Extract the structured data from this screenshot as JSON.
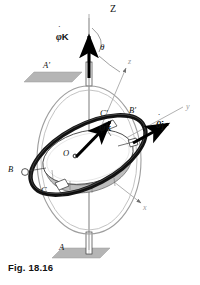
{
  "figure": {
    "caption": "Fig. 18.16",
    "background": "#ffffff"
  },
  "colors": {
    "ink": "#111111",
    "gimbal_outer": "#8f8f8f",
    "gimbal_inner": "#1a1a1a",
    "rotor_rim": "#b9b9b9",
    "rotor_face": "#ffffff",
    "support_plate": "#b5b5b5",
    "axis_light": "#9a9a9a",
    "vector_black": "#000000"
  },
  "axes": [
    {
      "id": "Z",
      "label": "Z",
      "style": "upright",
      "x": 112,
      "y": 8,
      "color": "#111111"
    },
    {
      "id": "z",
      "label": "z",
      "style": "italic",
      "x": 128,
      "y": 60,
      "color": "#9a9a9a"
    },
    {
      "id": "y",
      "label": "y",
      "style": "italic",
      "x": 186,
      "y": 108,
      "color": "#9a9a9a"
    },
    {
      "id": "x",
      "label": "x",
      "style": "italic",
      "x": 143,
      "y": 208,
      "color": "#9a9a9a"
    },
    {
      "id": "theta",
      "label": "θ",
      "style": "italic",
      "x": 101,
      "y": 45,
      "color": "#111111"
    }
  ],
  "vectors": [
    {
      "id": "phi-dot-K",
      "symbol": "φ",
      "accent": "˙",
      "unit": "K",
      "label": "φ̇K",
      "description": "precession rate about fixed Z axis",
      "label_x": 57,
      "label_y": 38
    },
    {
      "id": "theta-dot-j",
      "symbol": "θ",
      "accent": "˙",
      "unit": "j",
      "label": "θ̇j",
      "description": "nutation rate about y axis",
      "label_x": 156,
      "label_y": 125
    },
    {
      "id": "psi-dot-k",
      "symbol": "ψ",
      "accent": "˙",
      "unit": "k",
      "label": "ψ̇k",
      "description": "spin rate about z axis of rotor",
      "label_x": 100,
      "label_y": 128
    }
  ],
  "points": [
    {
      "id": "A-prime",
      "label": "A'",
      "x": 43,
      "y": 66,
      "note": "upper support bearing"
    },
    {
      "id": "A",
      "label": "A",
      "x": 60,
      "y": 249,
      "note": "lower support bearing"
    },
    {
      "id": "B-prime",
      "label": "B'",
      "x": 130,
      "y": 111,
      "note": "outer gimbal bearing right"
    },
    {
      "id": "B",
      "label": "B",
      "x": 9,
      "y": 165,
      "note": "outer gimbal bearing left"
    },
    {
      "id": "C-prime",
      "label": "C'",
      "x": 100,
      "y": 113,
      "note": "inner gimbal bearing upper"
    },
    {
      "id": "C",
      "label": "C",
      "x": 42,
      "y": 190,
      "note": "inner gimbal bearing lower"
    },
    {
      "id": "O",
      "label": "O",
      "x": 64,
      "y": 154,
      "note": "fixed point at centre"
    }
  ],
  "parts": [
    {
      "id": "outer-gimbal",
      "name": "outer gimbal ring"
    },
    {
      "id": "inner-gimbal",
      "name": "inner gimbal ring"
    },
    {
      "id": "rotor",
      "name": "spinning rotor disk"
    },
    {
      "id": "upper-plate",
      "name": "upper support plate"
    },
    {
      "id": "lower-plate",
      "name": "lower support plate"
    },
    {
      "id": "vertical-shaft",
      "name": "vertical shaft along Z"
    }
  ]
}
